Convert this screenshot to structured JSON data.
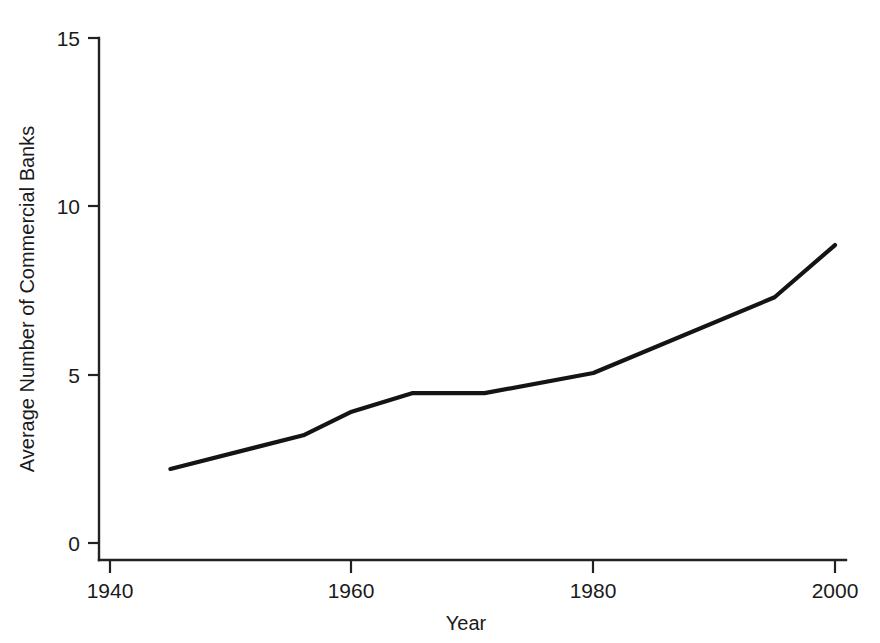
{
  "chart_data": {
    "type": "line",
    "title": "",
    "xlabel": "Year",
    "ylabel": "Average Number of Commercial Banks",
    "xlim": [
      1938,
      2002
    ],
    "ylim": [
      0,
      15
    ],
    "xticks": [
      1940,
      1960,
      1980,
      2000
    ],
    "xtick_labels": [
      "1940",
      "1960",
      "1980",
      "2000"
    ],
    "yticks": [
      0,
      5,
      10,
      15
    ],
    "ytick_labels": [
      "0",
      "5",
      "10",
      "15"
    ],
    "grid": false,
    "legend": false,
    "legend_position": "none",
    "line_color": "#141414",
    "series": [
      {
        "name": "Average Number of Commercial Banks",
        "x": [
          1945,
          1956,
          1960,
          1965,
          1971,
          1980,
          1995,
          2000
        ],
        "values": [
          2.2,
          3.2,
          3.9,
          4.45,
          4.45,
          5.05,
          7.3,
          8.85
        ]
      }
    ]
  },
  "axes": {
    "y_title": "Average Number of Commercial Banks",
    "x_title": "Year",
    "y_labels": [
      "15",
      "10",
      "5",
      "0"
    ],
    "x_labels": [
      "1940",
      "1960",
      "1980",
      "2000"
    ]
  }
}
